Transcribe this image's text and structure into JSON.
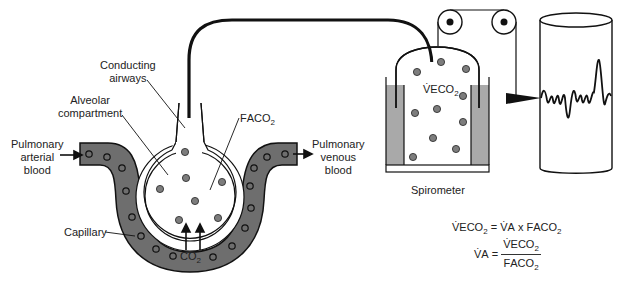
{
  "figure": {
    "labels": {
      "conducting_airways": [
        "Conducting",
        "airways"
      ],
      "alveolar_compartment": [
        "Alveolar",
        "compartment"
      ],
      "faco2": {
        "main": "F",
        "sc": "ACO",
        "sub": "2"
      },
      "pulmonary_arterial": [
        "Pulmonary",
        "arterial",
        "blood"
      ],
      "pulmonary_venous": [
        "Pulmonary",
        "venous",
        "blood"
      ],
      "capillary": "Capillary",
      "co2": {
        "main": "CO",
        "sub": "2"
      },
      "veco2": {
        "main": "V̇",
        "sc": "ECO",
        "sub": "2"
      },
      "spirometer": "Spirometer"
    },
    "equations": {
      "eq1": {
        "lhs": {
          "main": "V̇",
          "sc": "ECO",
          "sub": "2"
        },
        "op": "=",
        "rhs1": {
          "main": "V̇",
          "sc": "A"
        },
        "times": "x",
        "rhs2": {
          "main": "F",
          "sc": "ACO",
          "sub": "2"
        }
      },
      "eq2": {
        "lhs": {
          "main": "V̇",
          "sc": "A"
        },
        "op": "=",
        "numerator": {
          "main": "V̇",
          "sc": "ECO",
          "sub": "2"
        },
        "denominator": {
          "main": "F",
          "sc": "ACO",
          "sub": "2"
        }
      }
    },
    "colors": {
      "capillary_fill": "#6e6e6e",
      "water_fill": "#a9a9a9",
      "molecule_fill": "#7d7d7d",
      "stroke": "#111111"
    }
  }
}
